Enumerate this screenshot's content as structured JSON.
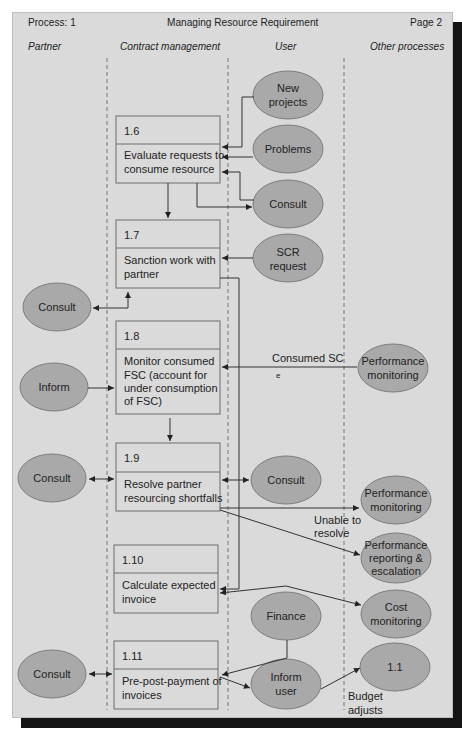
{
  "header": {
    "process": "Process: 1",
    "title": "Managing Resource Requirement",
    "page": "Page 2"
  },
  "lanes": [
    "Partner",
    "Contract management",
    "User",
    "Other processes"
  ],
  "processes": [
    {
      "id": "1.6",
      "lines": [
        "Evaluate requests to",
        "consume resource"
      ]
    },
    {
      "id": "1.7",
      "lines": [
        "Sanction work with",
        "partner"
      ]
    },
    {
      "id": "1.8",
      "lines": [
        "Monitor consumed",
        "FSC (account for",
        "under consumption",
        "of FSC)"
      ]
    },
    {
      "id": "1.9",
      "lines": [
        "Resolve partner",
        "resourcing shortfalls"
      ]
    },
    {
      "id": "1.10",
      "lines": [
        "Calculate expected",
        "invoice"
      ]
    },
    {
      "id": "1.11",
      "lines": [
        "Pre-post-payment of",
        "invoices"
      ]
    }
  ],
  "entities": {
    "new_projects": [
      "New",
      "projects"
    ],
    "problems": [
      "Problems"
    ],
    "consult_user_1": [
      "Consult"
    ],
    "scr_request": [
      "SCR",
      "request"
    ],
    "consult_partner_1": [
      "Consult"
    ],
    "inform_partner": [
      "Inform"
    ],
    "performance_monitoring_1": [
      "Performance",
      "monitoring"
    ],
    "consult_partner_2": [
      "Consult"
    ],
    "consult_user_2": [
      "Consult"
    ],
    "performance_monitoring_2": [
      "Performance",
      "monitoring"
    ],
    "performance_reporting": [
      "Performance",
      "reporting &",
      "escalation"
    ],
    "cost_monitoring": [
      "Cost",
      "monitoring"
    ],
    "finance": [
      "Finance"
    ],
    "consult_partner_3": [
      "Consult"
    ],
    "inform_user": [
      "Inform",
      "user"
    ],
    "process_1_1": [
      "1.1"
    ]
  },
  "annotations": {
    "consumed_sc": "Consumed SC",
    "consumed_sc_mark": "e",
    "unable_to_resolve": [
      "Unable to",
      "resolve"
    ],
    "budget_adjusts": [
      "Budget",
      "adjusts"
    ]
  },
  "colors": {
    "page_bg": "#dadada",
    "entity_fill": "#a9a9a9",
    "shadow": "#141414"
  }
}
